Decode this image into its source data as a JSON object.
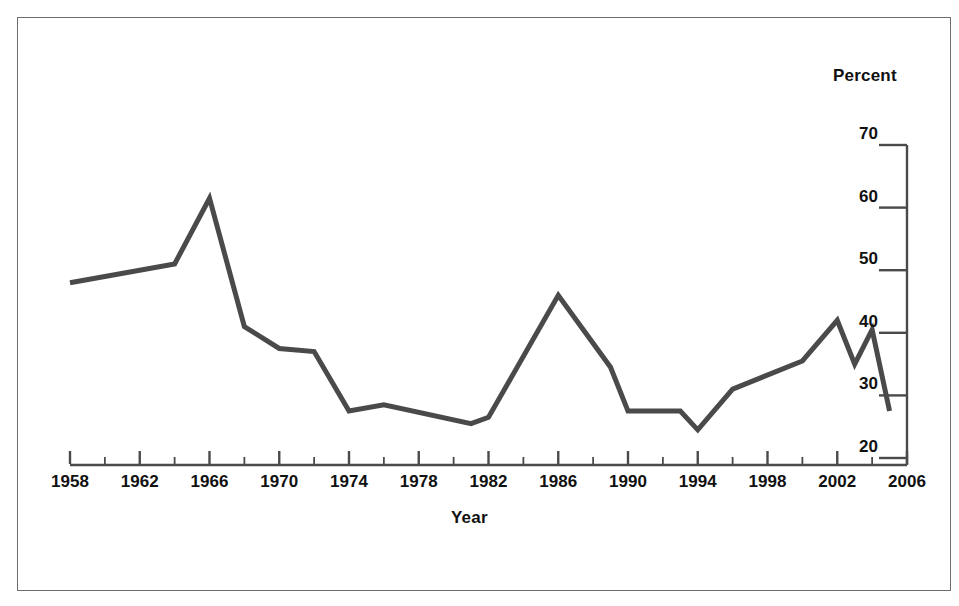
{
  "figure": {
    "frame_color": "#6d6d6d",
    "background": "#ffffff"
  },
  "chart_data": {
    "type": "line",
    "title": "",
    "subtitle": "",
    "xlabel": "Year",
    "ylabel": "Percent",
    "ylabel_position": "top-right",
    "yaxis_position": "right",
    "xlim": [
      1958,
      2006
    ],
    "ylim": [
      20,
      70
    ],
    "grid": false,
    "legend": null,
    "line_color": "#4a4a4a",
    "line_width": 5,
    "x_tick_labels": [
      "1958",
      "1962",
      "1966",
      "1970",
      "1974",
      "1978",
      "1982",
      "1986",
      "1990",
      "1994",
      "1998",
      "2002",
      "2006"
    ],
    "x_major_ticks": [
      1958,
      1962,
      1966,
      1970,
      1974,
      1978,
      1982,
      1986,
      1990,
      1994,
      1998,
      2002,
      2006
    ],
    "x_minor_ticks": [
      1960,
      1964,
      1968,
      1972,
      1976,
      1980,
      1984,
      1988,
      1992,
      1996,
      2000,
      2004
    ],
    "y_tick_labels": [
      "70",
      "60",
      "50",
      "40",
      "30",
      "20"
    ],
    "y_ticks": [
      70,
      60,
      50,
      40,
      30,
      20
    ],
    "x": [
      1958,
      1964,
      1966,
      1968,
      1970,
      1972,
      1974,
      1976,
      1981,
      1982,
      1986,
      1989,
      1990,
      1993,
      1994,
      1996,
      2000,
      2002,
      2003,
      2004,
      2005
    ],
    "values": [
      48.0,
      51.0,
      61.5,
      41.0,
      37.5,
      37.0,
      27.5,
      28.5,
      25.5,
      26.5,
      46.0,
      34.5,
      27.5,
      27.5,
      24.5,
      31.0,
      35.5,
      42.0,
      35.0,
      40.5,
      27.5
    ],
    "series": [
      {
        "name": "Percent",
        "x": [
          1958,
          1964,
          1966,
          1968,
          1970,
          1972,
          1974,
          1976,
          1981,
          1982,
          1986,
          1989,
          1990,
          1993,
          1994,
          1996,
          2000,
          2002,
          2003,
          2004,
          2005
        ],
        "values": [
          48.0,
          51.0,
          61.5,
          41.0,
          37.5,
          37.0,
          27.5,
          28.5,
          25.5,
          26.5,
          46.0,
          34.5,
          27.5,
          27.5,
          24.5,
          31.0,
          35.5,
          42.0,
          35.0,
          40.5,
          27.5
        ]
      }
    ]
  }
}
